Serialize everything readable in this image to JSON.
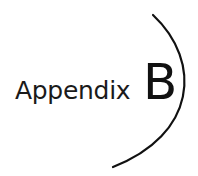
{
  "heading": {
    "word": "Appendix",
    "letter": "B"
  },
  "colors": {
    "text": "#1a1a1a",
    "arc": "#111111",
    "background": "#ffffff"
  }
}
